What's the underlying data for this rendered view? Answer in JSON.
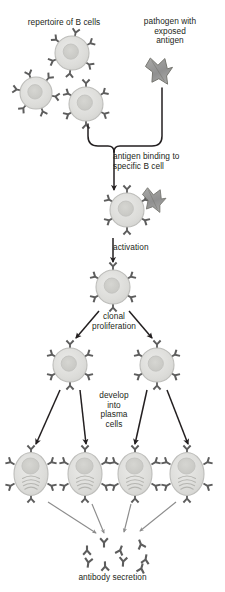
{
  "figure": {
    "background_color": "#ffffff",
    "text_color": "#231f20"
  },
  "labels": {
    "repertoire": "repertoire of B cells",
    "pathogen": "pathogen with\nexposed\nantigen",
    "antigen_binding": "antigen binding to\nspecific B cell",
    "activation": "activation",
    "clonal_proliferation": "clonal\nproliferation",
    "develop_into_plasma_cells": "develop\ninto\nplasma\ncells",
    "antibody_secretion": "antibody secretion"
  },
  "colors": {
    "cell_fill": "#dededc",
    "cell_stroke": "#b9b9b6",
    "nucleus_fill": "#cfcfcb",
    "nucleus_stroke": "#c2c2be",
    "receptor_fill": "#5d5d5d",
    "antigen_fill": "#9a9a98",
    "antigen_stroke": "#6e6e6c",
    "arrow_dark": "#231f20",
    "arrow_light": "#8c8c8c",
    "brace_stroke": "#231f20"
  },
  "elements": {
    "repertoire_b_cells": [
      {
        "name": "b-cell-top",
        "cx": 72,
        "cy": 53,
        "r": 17,
        "receptor_rotation": 12
      },
      {
        "name": "b-cell-left",
        "cx": 36,
        "cy": 93,
        "r": 16,
        "receptor_rotation": 40
      },
      {
        "name": "b-cell-right",
        "cx": 86,
        "cy": 104,
        "r": 17,
        "receptor_rotation": 0
      }
    ],
    "pathogen": {
      "name": "pathogen-antigen",
      "cx": 158,
      "cy": 70
    },
    "selected_b_cell": {
      "name": "b-cell-antigen-bound",
      "cx": 127,
      "cy": 210,
      "r": 17
    },
    "bound_antigen": {
      "name": "bound-antigen",
      "cx": 152,
      "cy": 200
    },
    "activated_b_cell": {
      "name": "b-cell-activated",
      "cx": 113,
      "cy": 287,
      "r": 17
    },
    "proliferated_b_cells": [
      {
        "name": "b-cell-clone-left",
        "cx": 70,
        "cy": 365,
        "r": 17
      },
      {
        "name": "b-cell-clone-right",
        "cx": 157,
        "cy": 365,
        "r": 17
      }
    ],
    "plasma_cells": [
      {
        "name": "plasma-cell-1",
        "cx": 31,
        "cy": 474
      },
      {
        "name": "plasma-cell-2",
        "cx": 85,
        "cy": 474
      },
      {
        "name": "plasma-cell-3",
        "cx": 135,
        "cy": 474
      },
      {
        "name": "plasma-cell-4",
        "cx": 187,
        "cy": 474
      }
    ],
    "secreted_antibodies": [
      {
        "name": "antibody-1",
        "x": 87,
        "y": 545,
        "rot": 180
      },
      {
        "name": "antibody-2",
        "x": 105,
        "y": 542,
        "rot": 0
      },
      {
        "name": "antibody-3",
        "x": 122,
        "y": 545,
        "rot": 200
      },
      {
        "name": "antibody-4",
        "x": 141,
        "y": 539,
        "rot": 160
      },
      {
        "name": "antibody-5",
        "x": 146,
        "y": 554,
        "rot": 190
      },
      {
        "name": "antibody-6",
        "x": 88,
        "y": 562,
        "rot": 10
      },
      {
        "name": "antibody-7",
        "x": 106,
        "y": 562,
        "rot": 175
      },
      {
        "name": "antibody-8",
        "x": 124,
        "y": 561,
        "rot": 5
      },
      {
        "name": "antibody-9",
        "x": 143,
        "y": 563,
        "rot": 195
      }
    ]
  }
}
